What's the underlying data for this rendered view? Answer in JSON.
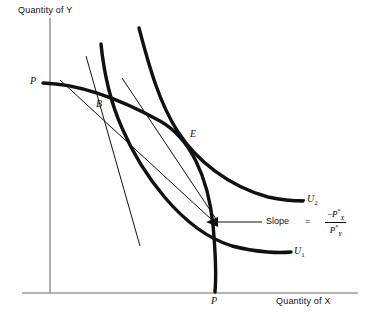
{
  "figure": {
    "type": "economics-diagram"
  },
  "axes": {
    "y_label": "Quantity of Y",
    "x_label": "Quantity of X",
    "y_axis_color": "#9a9a9a",
    "x_axis_color": "#9a9a9a"
  },
  "points": [
    {
      "id": "p-vertical",
      "label": "P"
    },
    {
      "id": "point-b",
      "label": "B"
    },
    {
      "id": "point-e",
      "label": "E"
    },
    {
      "id": "p-horizontal",
      "label": "P"
    }
  ],
  "curves": [
    {
      "id": "u2",
      "label": "U",
      "subscript": "2",
      "color": "#111111"
    },
    {
      "id": "u1",
      "label": "U",
      "subscript": "1",
      "color": "#111111"
    }
  ],
  "annotation": {
    "slope_word": "Slope",
    "equals": "=",
    "numerator_sign": "−",
    "numerator_base": "P",
    "numerator_star": "*",
    "numerator_sub": "X",
    "denominator_base": "P",
    "denominator_star": "*",
    "denominator_sub": "Y"
  },
  "colors": {
    "curve": "#111111",
    "tangent": "#111111",
    "axis": "#9a9a9a",
    "background": "#ffffff"
  }
}
